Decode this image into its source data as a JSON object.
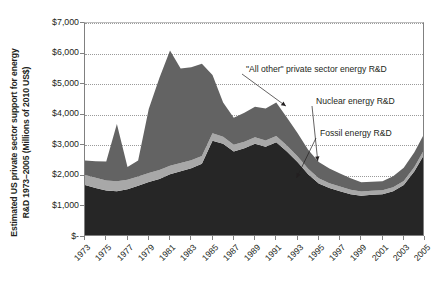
{
  "chart_data": {
    "type": "area",
    "stacked": true,
    "title": "",
    "subtitle": "",
    "xlabel": "",
    "ylabel": "Estimated US private sector support for energy R&D 1973–2005 (Millions of 2010 US$)",
    "ylabel_lines": [
      "Estimated US private sector support for energy",
      "R&D 1973–2005 (Millions of 2010 US$)"
    ],
    "grid": true,
    "legend_position": "annotations-right",
    "ylim": [
      0,
      7000
    ],
    "ytick_values": [
      0,
      1000,
      2000,
      3000,
      4000,
      5000,
      6000,
      7000
    ],
    "ytick_labels": [
      "$-",
      "$1,000",
      "$2,000",
      "$3,000",
      "$4,000",
      "$5,000",
      "$6,000",
      "$7,000"
    ],
    "xlim": [
      1973,
      2005
    ],
    "x": [
      1973,
      1974,
      1975,
      1976,
      1977,
      1978,
      1979,
      1980,
      1981,
      1982,
      1983,
      1984,
      1985,
      1986,
      1987,
      1988,
      1989,
      1990,
      1991,
      1992,
      1993,
      1994,
      1995,
      1996,
      1997,
      1998,
      1999,
      2000,
      2001,
      2002,
      2003,
      2004,
      2005
    ],
    "xtick_labels": [
      "1973",
      "1975",
      "1977",
      "1979",
      "1981",
      "1983",
      "1985",
      "1987",
      "1989",
      "1991",
      "1993",
      "1995",
      "1997",
      "1999",
      "2001",
      "2003",
      "2005"
    ],
    "xtick_values": [
      1973,
      1975,
      1977,
      1979,
      1981,
      1983,
      1985,
      1987,
      1989,
      1991,
      1993,
      1995,
      1997,
      1999,
      2001,
      2003,
      2005
    ],
    "series": [
      {
        "name": "Fossil energy R&D",
        "color": "#262626",
        "values": [
          1700,
          1600,
          1520,
          1500,
          1560,
          1680,
          1800,
          1900,
          2050,
          2150,
          2250,
          2400,
          3150,
          3050,
          2800,
          2900,
          3050,
          2950,
          3100,
          2800,
          2450,
          2050,
          1750,
          1600,
          1500,
          1400,
          1350,
          1380,
          1400,
          1500,
          1700,
          2150,
          2750
        ]
      },
      {
        "name": "Nuclear energy R&D",
        "color": "#a8a8a8",
        "values": [
          330,
          340,
          330,
          320,
          310,
          300,
          290,
          290,
          280,
          270,
          260,
          250,
          240,
          230,
          220,
          215,
          210,
          205,
          200,
          195,
          190,
          180,
          170,
          160,
          150,
          145,
          140,
          135,
          130,
          130,
          135,
          140,
          150
        ]
      },
      {
        "name": "\"All other\" private sector energy R&D",
        "color": "#636363",
        "values": [
          470,
          540,
          620,
          1880,
          420,
          520,
          2100,
          3010,
          3770,
          3090,
          3040,
          3020,
          1910,
          1120,
          880,
          950,
          1000,
          1050,
          1100,
          910,
          760,
          620,
          530,
          480,
          430,
          380,
          300,
          290,
          290,
          360,
          430,
          480,
          530
        ]
      }
    ],
    "annotations": [
      {
        "text": "\"All other\" private sector energy R&D",
        "target_year": 1992,
        "target_value": 4250
      },
      {
        "text": "Nuclear energy R&D",
        "target_year": 1995,
        "target_value": 2450
      },
      {
        "text": "Fossil energy R&D",
        "target_year": 1993,
        "target_value": 1900
      }
    ]
  }
}
